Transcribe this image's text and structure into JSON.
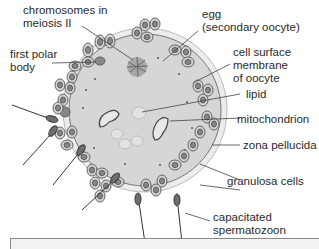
{
  "labels": {
    "chromosomes": "chromosomes in\nmeiosis II",
    "polar_body": "first polar\nbody",
    "egg": "egg\n(secondary oocyte)",
    "membrane": "cell surface\nmembrane\nof oocyte",
    "lipid": "lipid",
    "mitochondrion": "mitochondrion",
    "zona": "zona pellucida",
    "granulosa": "granulosa cells",
    "sperm": "capacitated\nspermatozoon"
  },
  "colors": {
    "cytoplasm": "#d6d6d6",
    "zona": "#ececec",
    "cell_fill": "#cfcfcf",
    "nucleus": "#7a7a7a",
    "sperm_head": "#6e6e6e",
    "line": "#444444"
  }
}
